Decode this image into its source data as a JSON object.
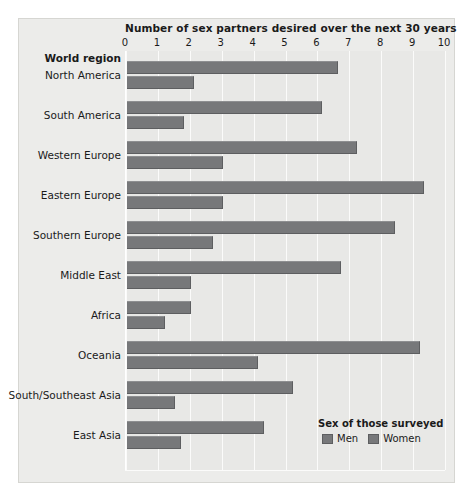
{
  "chart_data": {
    "type": "bar",
    "orientation": "horizontal",
    "title": "Number of sex partners desired over the next 30 years",
    "xlabel": "Number of sex partners desired over the next 30 years",
    "ylabel": "World region",
    "xlim": [
      0,
      10
    ],
    "xticks": [
      "0",
      "1",
      "2",
      "3",
      "4",
      "5",
      "6",
      "7",
      "8",
      "9",
      "10"
    ],
    "grid": true,
    "legend_title": "Sex of those surveyed",
    "legend_position": "bottom-right",
    "categories": [
      "North America",
      "South America",
      "Western Europe",
      "Eastern Europe",
      "Southern Europe",
      "Middle East",
      "Africa",
      "Oceania",
      "South/Southeast Asia",
      "East Asia"
    ],
    "series": [
      {
        "name": "Men",
        "color": "#77787a",
        "values": [
          6.6,
          6.1,
          7.2,
          9.3,
          8.4,
          6.7,
          2.0,
          9.2,
          5.2,
          4.3
        ]
      },
      {
        "name": "Women",
        "color": "#77787a",
        "values": [
          2.1,
          1.8,
          3.0,
          3.0,
          2.7,
          2.0,
          1.2,
          4.1,
          1.5,
          1.7
        ]
      }
    ]
  },
  "legend": {
    "title": "Sex of those surveyed",
    "items": [
      {
        "label": "Men"
      },
      {
        "label": "Women"
      }
    ]
  },
  "axis": {
    "category_header": "World region"
  },
  "colors": {
    "bar": "#77787a",
    "bar_edge": "#5d5e60",
    "plot_background": "#e8e8e6",
    "figure_background": "#ececea",
    "gridline": "#fbfbfa",
    "text": "#1a1a1a"
  }
}
